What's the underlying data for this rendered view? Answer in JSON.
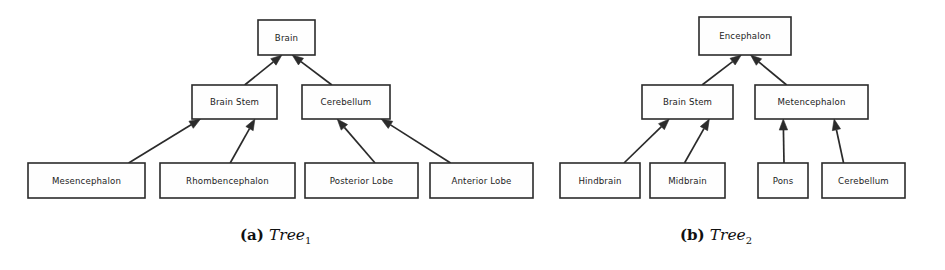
{
  "figure": {
    "background_color": "#ffffff",
    "line_color": "#2b2b2b",
    "box_fill_color": "#fefefe",
    "text_color": "#1c1c1c"
  },
  "trees": [
    {
      "id": "tree-1",
      "caption_tag": "(a)",
      "caption_name": "Tree",
      "caption_subscript": "1",
      "nodes": [
        {
          "id": "brain",
          "label": "Brain",
          "x": 258,
          "y": 20,
          "w": 57,
          "h": 35
        },
        {
          "id": "brain-stem",
          "label": "Brain Stem",
          "x": 192,
          "y": 85,
          "w": 85,
          "h": 34
        },
        {
          "id": "cerebellum",
          "label": "Cerebellum",
          "x": 302,
          "y": 85,
          "w": 88,
          "h": 34
        },
        {
          "id": "mesencephalon",
          "label": "Mesencephalon",
          "x": 28,
          "y": 163,
          "w": 117,
          "h": 35
        },
        {
          "id": "rhombencephalon",
          "label": "Rhombencephalon",
          "x": 160,
          "y": 163,
          "w": 135,
          "h": 35
        },
        {
          "id": "posterior-lobe",
          "label": "Posterior Lobe",
          "x": 305,
          "y": 163,
          "w": 113,
          "h": 35
        },
        {
          "id": "anterior-lobe",
          "label": "Anterior Lobe",
          "x": 430,
          "y": 163,
          "w": 103,
          "h": 35
        }
      ],
      "edges": [
        {
          "from": "brain-stem",
          "to": "brain"
        },
        {
          "from": "cerebellum",
          "to": "brain"
        },
        {
          "from": "mesencephalon",
          "to": "brain-stem"
        },
        {
          "from": "rhombencephalon",
          "to": "brain-stem"
        },
        {
          "from": "posterior-lobe",
          "to": "cerebellum"
        },
        {
          "from": "anterior-lobe",
          "to": "cerebellum"
        }
      ]
    },
    {
      "id": "tree-2",
      "caption_tag": "(b)",
      "caption_name": "Tree",
      "caption_subscript": "2",
      "nodes": [
        {
          "id": "encephalon",
          "label": "Encephalon",
          "x": 699,
          "y": 17,
          "w": 92,
          "h": 38
        },
        {
          "id": "brain-stem-2",
          "label": "Brain Stem",
          "x": 642,
          "y": 85,
          "w": 91,
          "h": 34
        },
        {
          "id": "metencephalon",
          "label": "Metencephalon",
          "x": 755,
          "y": 85,
          "w": 113,
          "h": 34
        },
        {
          "id": "hindbrain",
          "label": "Hindbrain",
          "x": 560,
          "y": 163,
          "w": 80,
          "h": 35
        },
        {
          "id": "midbrain",
          "label": "Midbrain",
          "x": 650,
          "y": 163,
          "w": 75,
          "h": 35
        },
        {
          "id": "pons",
          "label": "Pons",
          "x": 758,
          "y": 163,
          "w": 50,
          "h": 35
        },
        {
          "id": "cerebellum-2",
          "label": "Cerebellum",
          "x": 822,
          "y": 163,
          "w": 83,
          "h": 35
        }
      ],
      "edges": [
        {
          "from": "brain-stem-2",
          "to": "encephalon"
        },
        {
          "from": "metencephalon",
          "to": "encephalon"
        },
        {
          "from": "hindbrain",
          "to": "brain-stem-2"
        },
        {
          "from": "midbrain",
          "to": "brain-stem-2"
        },
        {
          "from": "pons",
          "to": "metencephalon"
        },
        {
          "from": "cerebellum-2",
          "to": "metencephalon"
        }
      ]
    }
  ]
}
